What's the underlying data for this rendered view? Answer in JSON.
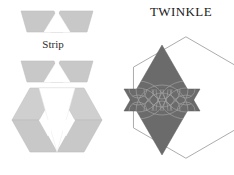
{
  "figure": {
    "kind": "quilt-block-pattern-diagram",
    "background_color": "#ffffff"
  },
  "title": {
    "text": "TWINKLE",
    "style": "small-caps-serif",
    "color": "#1a1a1a"
  },
  "labels": {
    "strip": "Strip"
  },
  "colors": {
    "light_fabric": "#c8c8c8",
    "light_fabric_alt": "#cfcfcf",
    "light_fabric_shade": "#c0c0c0",
    "dark_fabric": "#6b6b6b",
    "dark_fabric_shade": "#5f5f5f",
    "outline": "#9a9a9a",
    "quilting_line": "#a9a9a9",
    "white_fabric": "#ffffff",
    "text": "#1a1a1a"
  },
  "left_column": {
    "pieces": [
      {
        "name": "strip-unit-top",
        "description": "pieced strip of two light trapezoids with white triangle notch",
        "fill": "#c8c8c8"
      },
      {
        "name": "strip-unit-second",
        "description": "second pieced strip of two light trapezoids with white triangle notch",
        "fill": "#c8c8c8"
      },
      {
        "name": "assembled-hexagon",
        "description": "hexagon assembled from light diamonds and triangles around a white center triangle",
        "fill": "#c8c8c8"
      }
    ]
  },
  "right_column": {
    "pieces": [
      {
        "name": "hexagon-outline",
        "description": "hexagon outline background",
        "stroke": "#9a9a9a"
      },
      {
        "name": "six-pointed-star",
        "description": "dark six-pointed star with curved fan quilting lines",
        "fill": "#6b6b6b"
      }
    ],
    "quilting": {
      "motif": "curved fan arcs",
      "color": "#a9a9a9"
    }
  }
}
